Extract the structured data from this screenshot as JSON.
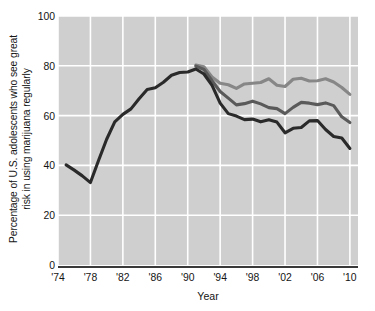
{
  "chart_data": {
    "type": "line",
    "title": "",
    "xlabel": "Year",
    "ylabel_line1": "Percentage of U.S. adolescents who see great",
    "ylabel_line2": "risk in using marijuana regularly",
    "xlim": [
      1974,
      2011
    ],
    "ylim": [
      0,
      100
    ],
    "yticks": [
      0,
      20,
      40,
      60,
      80,
      100
    ],
    "ytick_labels": [
      "0",
      "20",
      "40",
      "60",
      "80",
      "100"
    ],
    "xticks": [
      1974,
      1978,
      1982,
      1986,
      1990,
      1994,
      1998,
      2002,
      2006,
      2010
    ],
    "xtick_labels": [
      "'74",
      "'78",
      "'82",
      "'86",
      "'90",
      "'94",
      "'98",
      "'02",
      "'06",
      "'10"
    ],
    "grid": true,
    "grid_color": "#ffffff",
    "plot_background": "#cfcfcf",
    "legend": "none",
    "series": [
      {
        "name": "12th graders",
        "color": "#2a2a2a",
        "x": [
          1975,
          1976,
          1977,
          1978,
          1979,
          1980,
          1981,
          1982,
          1983,
          1984,
          1985,
          1986,
          1987,
          1988,
          1989,
          1990,
          1991,
          1992,
          1993,
          1994,
          1995,
          1996,
          1997,
          1998,
          1999,
          2000,
          2001,
          2002,
          2003,
          2004,
          2005,
          2006,
          2007,
          2008,
          2009,
          2010
        ],
        "values": [
          40.2,
          38.1,
          35.8,
          33.1,
          42.0,
          50.5,
          57.5,
          60.5,
          62.7,
          66.8,
          70.5,
          71.2,
          73.4,
          76.2,
          77.3,
          77.5,
          78.7,
          76.7,
          72.1,
          65.0,
          60.8,
          59.8,
          58.4,
          58.6,
          57.5,
          58.3,
          57.4,
          53.1,
          54.9,
          55.2,
          57.9,
          58.0,
          54.4,
          51.6,
          51.0,
          46.8
        ]
      },
      {
        "name": "10th graders",
        "color": "#5a5a5a",
        "x": [
          1991,
          1992,
          1993,
          1994,
          1995,
          1996,
          1997,
          1998,
          1999,
          2000,
          2001,
          2002,
          2003,
          2004,
          2005,
          2006,
          2007,
          2008,
          2009,
          2010
        ],
        "values": [
          79.9,
          78.5,
          74.0,
          69.7,
          67.0,
          64.3,
          64.8,
          65.8,
          64.7,
          63.2,
          62.8,
          60.8,
          63.3,
          65.3,
          65.0,
          64.4,
          65.1,
          64.0,
          59.5,
          57.2
        ]
      },
      {
        "name": "8th graders",
        "color": "#878787",
        "x": [
          1991,
          1992,
          1993,
          1994,
          1995,
          1996,
          1997,
          1998,
          1999,
          2000,
          2001,
          2002,
          2003,
          2004,
          2005,
          2006,
          2007,
          2008,
          2009,
          2010
        ],
        "values": [
          80.3,
          79.6,
          75.5,
          73.0,
          72.4,
          70.9,
          72.7,
          73.0,
          73.3,
          74.8,
          72.2,
          71.7,
          74.6,
          75.0,
          73.9,
          74.0,
          74.8,
          73.5,
          71.3,
          68.5
        ]
      }
    ]
  }
}
